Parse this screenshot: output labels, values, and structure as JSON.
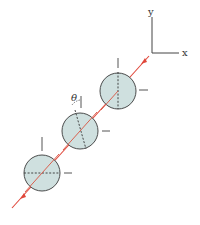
{
  "diagram": {
    "axes": {
      "x_label": "x",
      "y_label": "y"
    },
    "angle_label": "θ",
    "colors": {
      "line": "#e0473a",
      "disk_fill": "#cfe0df",
      "disk_stroke": "#3a3a3a",
      "ink": "#333333"
    },
    "disks": [
      {
        "name": "top-disk",
        "cx": 118,
        "cy": 91,
        "r": 18,
        "dash": "vertical"
      },
      {
        "name": "middle-disk",
        "cx": 80,
        "cy": 131,
        "r": 18,
        "dash": "tilted"
      },
      {
        "name": "bottom-disk",
        "cx": 42,
        "cy": 173,
        "r": 18,
        "dash": "horizontal"
      }
    ]
  }
}
